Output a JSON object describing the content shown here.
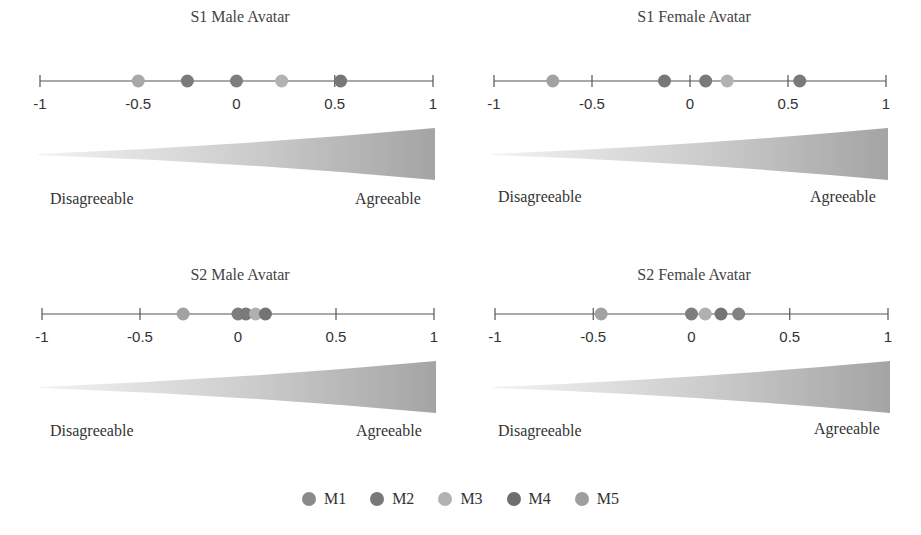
{
  "chart_data": {
    "type": "scatter",
    "subtype": "dot-strip",
    "xlim": [
      -1,
      1
    ],
    "ticks": [
      -1,
      -0.5,
      0,
      0.5,
      1
    ],
    "tick_labels": [
      "-1",
      "-0.5",
      "0",
      "0.5",
      "1"
    ],
    "pole_labels": {
      "left": "Disagreeable",
      "right": "Agreeable"
    },
    "series_names": [
      "M1",
      "M2",
      "M3",
      "M4",
      "M5"
    ],
    "series_colors": [
      "#8a8a8a",
      "#787878",
      "#b2b2b2",
      "#6e6e6e",
      "#9e9e9e"
    ],
    "panels": [
      {
        "title": "S1 Male Avatar",
        "points": [
          {
            "series": "M5",
            "x": -0.5,
            "color": "#a8a8a8"
          },
          {
            "series": "M2",
            "x": -0.25,
            "color": "#7a7a7a"
          },
          {
            "series": "M1",
            "x": 0.0,
            "color": "#7e7e7e"
          },
          {
            "series": "M3",
            "x": 0.23,
            "color": "#b2b2b2"
          },
          {
            "series": "M4",
            "x": 0.53,
            "color": "#777777"
          }
        ]
      },
      {
        "title": "S1 Female Avatar",
        "points": [
          {
            "series": "M5",
            "x": -0.7,
            "color": "#a2a2a2"
          },
          {
            "series": "M2",
            "x": -0.13,
            "color": "#777777"
          },
          {
            "series": "M1",
            "x": 0.08,
            "color": "#7a7a7a"
          },
          {
            "series": "M3",
            "x": 0.19,
            "color": "#b2b2b2"
          },
          {
            "series": "M4",
            "x": 0.56,
            "color": "#7a7a7a"
          }
        ]
      },
      {
        "title": "S2 Male Avatar",
        "points": [
          {
            "series": "M5",
            "x": -0.28,
            "color": "#a2a2a2"
          },
          {
            "series": "M1",
            "x": 0.0,
            "color": "#7e7e7e"
          },
          {
            "series": "M2",
            "x": 0.04,
            "color": "#7a7a7a"
          },
          {
            "series": "M3",
            "x": 0.09,
            "color": "#b0b0b0"
          },
          {
            "series": "M4",
            "x": 0.14,
            "color": "#747474"
          }
        ]
      },
      {
        "title": "S2 Female Avatar",
        "points": [
          {
            "series": "M5",
            "x": -0.46,
            "color": "#a2a2a2"
          },
          {
            "series": "M1",
            "x": 0.0,
            "color": "#7e7e7e"
          },
          {
            "series": "M3",
            "x": 0.07,
            "color": "#b0b0b0"
          },
          {
            "series": "M4",
            "x": 0.15,
            "color": "#747474"
          },
          {
            "series": "M2",
            "x": 0.24,
            "color": "#828282"
          }
        ]
      }
    ],
    "legend_position": "bottom"
  },
  "panels": [
    {
      "title": "S1 Male Avatar",
      "left_label": "Disagreeable",
      "right_label": "Agreeable"
    },
    {
      "title": "S1 Female Avatar",
      "left_label": "Disagreeable",
      "right_label": "Agreeable"
    },
    {
      "title": "S2 Male Avatar",
      "left_label": "Disagreeable",
      "right_label": "Agreeable"
    },
    {
      "title": "S2 Female Avatar",
      "left_label": "Disagreeable",
      "right_label": "Agreeable"
    }
  ],
  "legend": {
    "items": [
      {
        "label": "M1",
        "color": "#8a8a8a"
      },
      {
        "label": "M2",
        "color": "#787878"
      },
      {
        "label": "M3",
        "color": "#b2b2b2"
      },
      {
        "label": "M4",
        "color": "#6e6e6e"
      },
      {
        "label": "M5",
        "color": "#9e9e9e"
      }
    ]
  }
}
